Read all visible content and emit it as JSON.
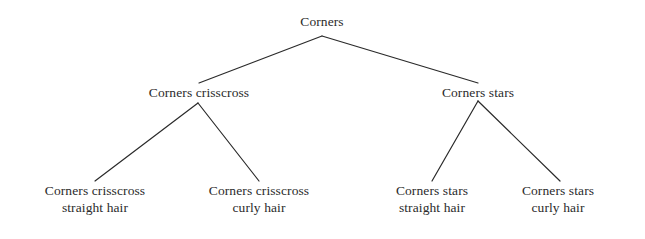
{
  "diagram": {
    "type": "tree",
    "orientation": "top-down",
    "canvas": {
      "width": 645,
      "height": 239
    },
    "style": {
      "background_color": "#ffffff",
      "edge_color": "#2a2a2a",
      "edge_width": 1.2,
      "text_color": "#2b2b2b"
    },
    "nodes": {
      "root": {
        "label": "Corners",
        "x": 322,
        "y": 26,
        "level": 0
      },
      "level1": [
        {
          "id": "crisscross",
          "label": "Corners crisscross",
          "x": 199,
          "y": 93,
          "level": 1
        },
        {
          "id": "stars",
          "label": "Corners stars",
          "x": 478,
          "y": 93,
          "level": 1
        }
      ],
      "level2": [
        {
          "id": "crisscross-straight",
          "line1": "Corners crisscross",
          "line2": "straight hair",
          "x": 95,
          "y": 190,
          "level": 2,
          "parent": "crisscross"
        },
        {
          "id": "crisscross-curly",
          "line1": "Corners crisscross",
          "line2": "curly hair",
          "x": 259,
          "y": 190,
          "level": 2,
          "parent": "crisscross"
        },
        {
          "id": "stars-straight",
          "line1": "Corners stars",
          "line2": "straight hair",
          "x": 432,
          "y": 190,
          "level": 2,
          "parent": "stars"
        },
        {
          "id": "stars-curly",
          "line1": "Corners stars",
          "line2": "curly hair",
          "x": 558,
          "y": 190,
          "level": 2,
          "parent": "stars"
        }
      ]
    },
    "edges": [
      {
        "from": "root",
        "to": "crisscross",
        "x1": 322,
        "y1": 36,
        "x2": 199,
        "y2": 83
      },
      {
        "from": "root",
        "to": "stars",
        "x1": 322,
        "y1": 36,
        "x2": 478,
        "y2": 83
      },
      {
        "from": "crisscross",
        "to": "crisscross-straight",
        "x1": 198,
        "y1": 103,
        "x2": 95,
        "y2": 181
      },
      {
        "from": "crisscross",
        "to": "crisscross-curly",
        "x1": 198,
        "y1": 103,
        "x2": 259,
        "y2": 181
      },
      {
        "from": "stars",
        "to": "stars-straight",
        "x1": 478,
        "y1": 101,
        "x2": 432,
        "y2": 181
      },
      {
        "from": "stars",
        "to": "stars-curly",
        "x1": 478,
        "y1": 101,
        "x2": 560,
        "y2": 181
      }
    ]
  }
}
